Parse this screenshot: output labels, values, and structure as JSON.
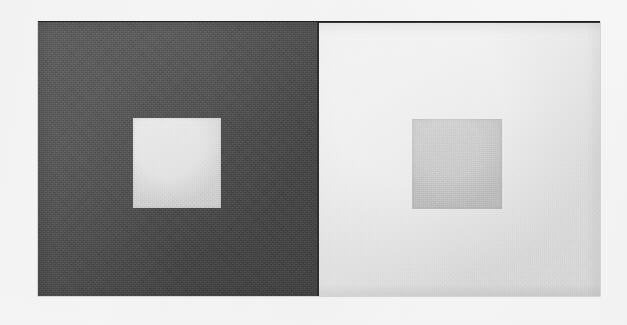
{
  "figure": {
    "name": "simultaneous-contrast-demonstration",
    "caption": "",
    "background_color": "#fbfbfb",
    "plate": {
      "x": 38,
      "y": 22,
      "width": 562,
      "height": 274,
      "border_color": "#2f2f2f",
      "top_rule_color": "#1e1e1e"
    },
    "panels": [
      {
        "id": "left",
        "label": "dark surround panel",
        "fill_color": "#4e4e4e",
        "x": 38,
        "y": 22,
        "width": 281,
        "height": 274,
        "target": {
          "label": "inner square on dark surround",
          "fill_color": "#d6d6d6",
          "x": 133,
          "y": 118,
          "width": 88,
          "height": 90
        }
      },
      {
        "id": "right",
        "label": "light surround panel",
        "fill_color": "#e4e4e4",
        "x": 319,
        "y": 22,
        "width": 281,
        "height": 274,
        "target": {
          "label": "inner square on light surround",
          "fill_color": "#c3c3c3",
          "x": 412,
          "y": 118,
          "width": 90,
          "height": 90
        }
      }
    ]
  }
}
